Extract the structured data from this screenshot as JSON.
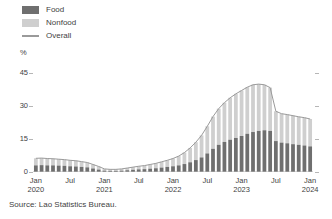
{
  "legend": {
    "items": [
      {
        "label": "Food",
        "type": "swatch",
        "color": "#6f6f6f"
      },
      {
        "label": "Nonfood",
        "type": "swatch",
        "color": "#cfcfcf"
      },
      {
        "label": "Overall",
        "type": "line",
        "color": "#9a9a9a"
      }
    ]
  },
  "axis": {
    "unit": "%",
    "y_ticks": [
      "0",
      "15",
      "30",
      "45"
    ],
    "x_ticks": [
      {
        "month": "Jan",
        "year": "2020"
      },
      {
        "month": "Jul",
        "year": ""
      },
      {
        "month": "Jan",
        "year": "2021"
      },
      {
        "month": "Jul",
        "year": ""
      },
      {
        "month": "Jan",
        "year": "2022"
      },
      {
        "month": "Jul",
        "year": ""
      },
      {
        "month": "Jan",
        "year": "2023"
      },
      {
        "month": "Jul",
        "year": ""
      },
      {
        "month": "Jan",
        "year": "2024"
      }
    ]
  },
  "source": "Source: Lao Statistics Bureau.",
  "chart_data": {
    "type": "bar",
    "title": "",
    "xlabel": "",
    "ylabel": "%",
    "ylim": [
      0,
      48
    ],
    "grid": false,
    "legend_position": "top-left",
    "stacked": true,
    "bar_colors": {
      "Food": "#6f6f6f",
      "Nonfood": "#cfcfcf"
    },
    "line_color": "#9a9a9a",
    "x": [
      "Jan 2020",
      "Feb 2020",
      "Mar 2020",
      "Apr 2020",
      "May 2020",
      "Jun 2020",
      "Jul 2020",
      "Aug 2020",
      "Sep 2020",
      "Oct 2020",
      "Nov 2020",
      "Dec 2020",
      "Jan 2021",
      "Feb 2021",
      "Mar 2021",
      "Apr 2021",
      "May 2021",
      "Jun 2021",
      "Jul 2021",
      "Aug 2021",
      "Sep 2021",
      "Oct 2021",
      "Nov 2021",
      "Dec 2021",
      "Jan 2022",
      "Feb 2022",
      "Mar 2022",
      "Apr 2022",
      "May 2022",
      "Jun 2022",
      "Jul 2022",
      "Aug 2022",
      "Sep 2022",
      "Oct 2022",
      "Nov 2022",
      "Dec 2022",
      "Jan 2023",
      "Feb 2023",
      "Mar 2023",
      "Apr 2023",
      "May 2023",
      "Jun 2023",
      "Jul 2023",
      "Aug 2023",
      "Sep 2023",
      "Oct 2023",
      "Nov 2023",
      "Dec 2023",
      "Jan 2024"
    ],
    "series": [
      {
        "name": "Food",
        "values": [
          3.0,
          3.1,
          3.0,
          3.0,
          2.9,
          2.8,
          2.6,
          2.5,
          2.3,
          2.1,
          1.6,
          1.1,
          0.6,
          0.5,
          0.5,
          0.6,
          0.8,
          1.0,
          1.2,
          1.3,
          1.5,
          1.7,
          2.0,
          2.3,
          2.6,
          3.0,
          3.6,
          4.4,
          5.4,
          6.6,
          8.4,
          10.5,
          12.3,
          13.6,
          14.6,
          15.4,
          16.3,
          17.3,
          18.1,
          18.6,
          18.9,
          18.6,
          14.0,
          13.3,
          13.0,
          12.6,
          12.3,
          12.0,
          11.6
        ]
      },
      {
        "name": "Nonfood",
        "values": [
          3.2,
          3.2,
          3.1,
          3.0,
          2.9,
          2.8,
          2.7,
          2.6,
          2.4,
          2.2,
          1.8,
          1.4,
          0.8,
          0.7,
          0.7,
          0.8,
          1.0,
          1.2,
          1.4,
          1.6,
          1.9,
          2.2,
          2.6,
          3.0,
          3.5,
          4.2,
          5.2,
          6.5,
          8.1,
          10.0,
          12.3,
          14.6,
          16.4,
          17.8,
          19.0,
          20.0,
          20.6,
          21.1,
          21.4,
          21.2,
          20.6,
          19.6,
          13.5,
          13.1,
          13.0,
          12.9,
          12.7,
          12.6,
          12.4
        ]
      }
    ],
    "overall": {
      "name": "Overall",
      "values": [
        6.2,
        6.3,
        6.1,
        6.0,
        5.8,
        5.6,
        5.3,
        5.1,
        4.7,
        4.3,
        3.4,
        2.5,
        1.4,
        1.2,
        1.2,
        1.4,
        1.8,
        2.2,
        2.6,
        2.9,
        3.4,
        3.9,
        4.6,
        5.3,
        6.1,
        7.2,
        8.8,
        10.9,
        13.5,
        16.6,
        20.7,
        25.1,
        28.7,
        31.4,
        33.6,
        35.4,
        36.9,
        38.4,
        39.5,
        39.8,
        39.5,
        38.2,
        27.5,
        26.4,
        26.0,
        25.5,
        25.0,
        24.6,
        24.0
      ]
    }
  }
}
